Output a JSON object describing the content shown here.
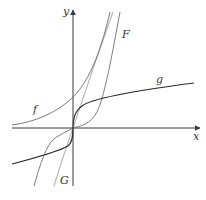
{
  "figure": {
    "axes": {
      "x_label": "x",
      "y_label": "y"
    },
    "curves": [
      {
        "id": "f",
        "label": "f",
        "shade": "#6e6e6e",
        "description": "increasing exponential-like curve, positive everywhere"
      },
      {
        "id": "g",
        "label": "g",
        "shade": "#2b2b2b",
        "description": "cube-root-like curve through origin"
      },
      {
        "id": "F",
        "label": "F",
        "shade": "#6e6e6e",
        "description": "cubic-like curve through origin, steep"
      },
      {
        "id": "G",
        "label": "G",
        "shade": "#b5b5b5",
        "description": "nearly straight steep line through origin"
      }
    ],
    "colors": {
      "background": "#ffffff",
      "axis": "#3a3a3a"
    }
  }
}
